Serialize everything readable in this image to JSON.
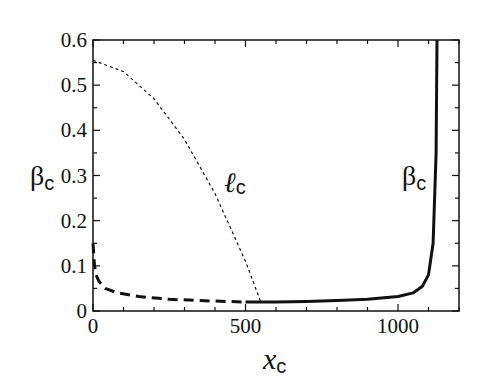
{
  "chart_data": {
    "type": "line",
    "title": "",
    "xlabel": "x_c",
    "ylabel": "β_c",
    "xlim": [
      0,
      1200
    ],
    "ylim": [
      0,
      0.6
    ],
    "x_ticks": [
      "0",
      "500",
      "1000"
    ],
    "y_ticks": [
      "0",
      "0.1",
      "0.2",
      "0.3",
      "0.4",
      "0.5",
      "0.6"
    ],
    "grid": false,
    "legend": "none",
    "annotations": [
      {
        "text": "ℓc",
        "x": 310,
        "y": 0.31
      },
      {
        "text": "βc",
        "x": 1040,
        "y": 0.31
      }
    ],
    "series": [
      {
        "name": "ℓc",
        "style": "thin dashed",
        "x": [
          0,
          100,
          200,
          300,
          400,
          500,
          550
        ],
        "y": [
          0.555,
          0.53,
          0.47,
          0.38,
          0.26,
          0.11,
          0.02
        ]
      },
      {
        "name": "βc (dashed branch)",
        "style": "thick dashed",
        "x": [
          0,
          5,
          10,
          20,
          40,
          80,
          150,
          250,
          400,
          500
        ],
        "y": [
          0.15,
          0.1,
          0.08,
          0.065,
          0.05,
          0.04,
          0.032,
          0.026,
          0.022,
          0.02
        ]
      },
      {
        "name": "βc",
        "style": "solid",
        "x": [
          500,
          600,
          700,
          800,
          900,
          1000,
          1050,
          1080,
          1100,
          1115,
          1125,
          1128
        ],
        "y": [
          0.02,
          0.02,
          0.021,
          0.023,
          0.026,
          0.032,
          0.04,
          0.055,
          0.08,
          0.15,
          0.35,
          0.6
        ]
      }
    ]
  },
  "labels": {
    "ylabel": "βc",
    "xlabel": "xc",
    "lc": "ℓc",
    "bc": "βc"
  }
}
